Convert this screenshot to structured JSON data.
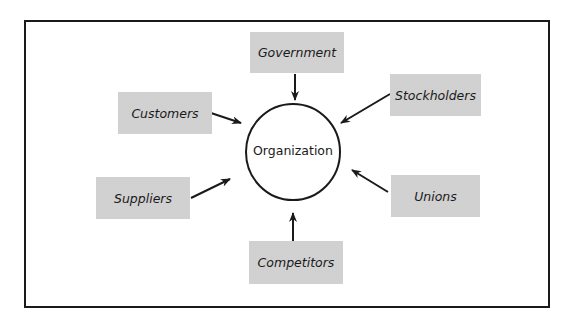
{
  "diagram": {
    "center": {
      "label": "Organization"
    },
    "stakeholders": [
      {
        "id": "government",
        "label": "Government",
        "position": "top"
      },
      {
        "id": "stockholders",
        "label": "Stockholders",
        "position": "top-right"
      },
      {
        "id": "unions",
        "label": "Unions",
        "position": "bottom-right"
      },
      {
        "id": "competitors",
        "label": "Competitors",
        "position": "bottom"
      },
      {
        "id": "suppliers",
        "label": "Suppliers",
        "position": "bottom-left"
      },
      {
        "id": "customers",
        "label": "Customers",
        "position": "top-left"
      }
    ],
    "edges": [
      {
        "from": "government",
        "to": "organization"
      },
      {
        "from": "stockholders",
        "to": "organization"
      },
      {
        "from": "unions",
        "to": "organization"
      },
      {
        "from": "competitors",
        "to": "organization"
      },
      {
        "from": "suppliers",
        "to": "organization"
      },
      {
        "from": "customers",
        "to": "organization"
      }
    ],
    "colors": {
      "line": "#1a1a1a",
      "box_fill": "#e2e2e2"
    }
  }
}
